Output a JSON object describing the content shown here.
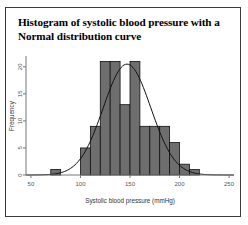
{
  "figure": {
    "title": "Histogram of systolic blood pressure with a Normal distribution curve",
    "title_line1": "Histogram of systolic blood pressure with a",
    "title_line2": "Normal distribution curve"
  },
  "chart_data": {
    "type": "bar",
    "title": "Histogram of systolic blood pressure with a Normal distribution curve",
    "xlabel": "Systolic blood pressure (mmHg)",
    "ylabel": "Frequency",
    "xlim": [
      45,
      255
    ],
    "ylim": [
      0,
      22
    ],
    "grid": false,
    "legend": null,
    "xticks": [
      50,
      100,
      150,
      200,
      250
    ],
    "yticks": [
      0,
      5,
      10,
      15,
      20
    ],
    "bin_width": 10,
    "bin_starts": [
      70,
      100,
      110,
      120,
      130,
      140,
      150,
      160,
      170,
      180,
      190,
      200,
      210
    ],
    "bin_labels": [
      "70-80",
      "100-110",
      "110-120",
      "120-130",
      "130-140",
      "140-150",
      "150-160",
      "160-170",
      "170-180",
      "180-190",
      "190-200",
      "200-210",
      "210-220"
    ],
    "categories": [
      "70-80",
      "100-110",
      "110-120",
      "120-130",
      "130-140",
      "140-150",
      "150-160",
      "160-170",
      "170-180",
      "180-190",
      "190-200",
      "200-210",
      "210-220"
    ],
    "values": [
      1,
      5,
      9,
      21,
      21,
      13,
      21,
      9,
      9,
      9,
      6,
      2,
      1
    ],
    "overlay": {
      "type": "line",
      "name": "Normal distribution curve",
      "mean": 147,
      "sd": 24,
      "peak_value": 20.5
    }
  },
  "axes": {
    "x_tick_labels": [
      "50",
      "100",
      "150",
      "200",
      "250"
    ],
    "y_tick_labels": [
      "0",
      "5",
      "10",
      "15",
      "20"
    ],
    "x_title": "Systolic blood pressure (mmHg)",
    "y_title": "Frequency"
  },
  "colors": {
    "bar_fill": "#6e6e6e",
    "bar_stroke": "#111111",
    "curve": "#111111",
    "axis": "#777777",
    "frame": "#3a3a3a",
    "text": "#000000"
  }
}
